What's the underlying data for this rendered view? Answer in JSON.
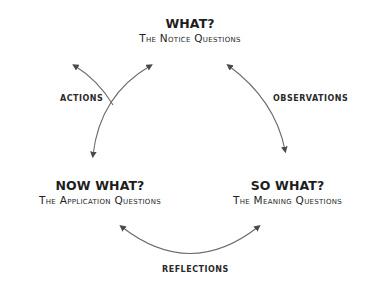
{
  "nodes": {
    "what": {
      "title": "WHAT?",
      "subtitle": "The Notice Questions"
    },
    "so_what": {
      "title": "SO WHAT?",
      "subtitle": "The Meaning Questions"
    },
    "now_what": {
      "title": "NOW WHAT?",
      "subtitle": "The Application Questions"
    }
  },
  "edges": {
    "observations": "Observations",
    "reflections": "Reflections",
    "actions": "Actions"
  },
  "colors": {
    "arrow": "#6a6a6a",
    "arrowhead": "#4a4a4a",
    "text": "#1e1e1e"
  }
}
